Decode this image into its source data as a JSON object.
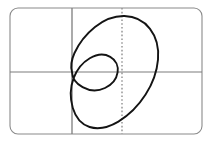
{
  "figure": {
    "kind": "polar-curve-plot",
    "background_color": "#ffffff",
    "frame": {
      "name": "rounded-rectangle-border",
      "x": 10,
      "y": 8,
      "width": 192,
      "height": 126,
      "corner_radius": 8,
      "stroke_color": "#8a8a8a",
      "stroke_width": 1.1
    },
    "axes": {
      "origin_x": 72,
      "origin_y": 72,
      "horizontal_axis": {
        "name": "x-axis",
        "y": 72,
        "x_start": 10,
        "x_end": 202,
        "stroke_color": "#7d7d7d",
        "stroke_width": 1.1
      },
      "vertical_axis": {
        "name": "y-axis",
        "x": 72,
        "y_start": 8,
        "y_end": 134,
        "stroke_color": "#7d7d7d",
        "stroke_width": 1.3
      },
      "dotted_line": {
        "name": "axis-of-symmetry-dotted-line",
        "x": 122,
        "y_start": 8,
        "y_end": 134,
        "stroke_color": "#8f8f8f",
        "stroke_width": 1.4,
        "dash_pattern": "1.6 2.2"
      }
    },
    "curve": {
      "name": "limacon-with-inner-loop",
      "stroke_color": "#141414",
      "stroke_width": 1.9,
      "fill": "none",
      "cusp_point": [
        72,
        72
      ],
      "outer_loop_extent": {
        "left_x": 75,
        "right_x": 155,
        "top_y": 16,
        "bottom_y": 128
      },
      "inner_loop_extent": {
        "left_x": 72,
        "right_x": 112,
        "top_y": 54,
        "bottom_y": 90
      },
      "path": "M 72,72 C 70.5,66.5 71.3,60.0 74.5,53.0 C 78.8,43.6 86.0,34.2 95.0,27.0 C 104.2,19.6 114.6,15.8 124.4,16.0 C 134.6,16.2 143.8,20.8 150.0,28.8 C 156.4,37.0 159.0,48.2 158.0,59.6 C 157.0,71.2 152.6,83.6 145.6,94.6 C 138.4,105.8 128.8,115.4 118.4,121.6 C 108.2,127.6 98.0,129.6 89.6,127.0 C 81.4,124.4 75.6,117.4 72.8,108.0 C 70.0,98.6 70.2,87.4 73.6,78.2 C 76.8,69.4 82.6,62.4 89.8,58.2 C 96.8,54.1 104.4,53.5 110.2,56.8 C 115.8,59.9 118.6,66.0 117.6,72.4 C 116.6,78.8 111.8,84.8 105.0,88.0 C 98.0,91.3 89.4,91.0 82.6,87.2 C 76.2,83.6 72.2,78.0 72,72 Z"
    }
  }
}
